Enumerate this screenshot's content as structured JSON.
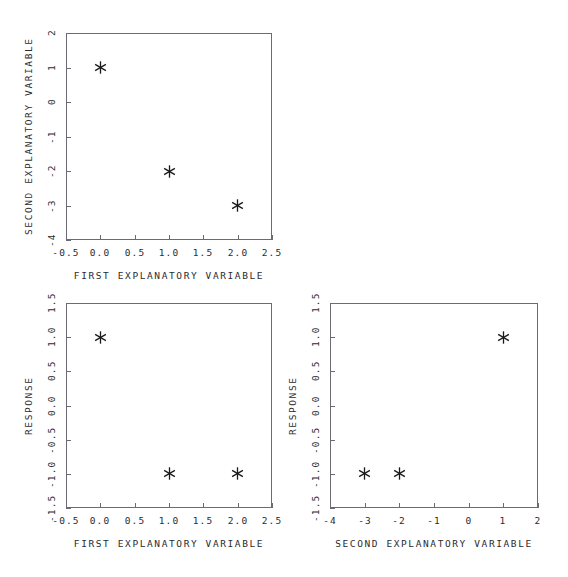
{
  "chart_data": [
    {
      "id": "top",
      "type": "scatter",
      "title": "",
      "xlabel": "FIRST EXPLANATORY VARIABLE",
      "ylabel": "SECOND EXPLANATORY VARIABLE",
      "xlim": [
        -0.5,
        2.5
      ],
      "ylim": [
        -4,
        2
      ],
      "xticks": [
        -0.5,
        0.0,
        0.5,
        1.0,
        1.5,
        2.0,
        2.5
      ],
      "xticklabels": [
        "-0.5",
        "0.0",
        "0.5",
        "1.0",
        "1.5",
        "2.0",
        "2.5"
      ],
      "yticks": [
        -4,
        -3,
        -2,
        -1,
        0,
        1,
        2
      ],
      "yticklabels": [
        "-4",
        "-3",
        "-2",
        "-1",
        "0",
        "1",
        "2"
      ],
      "grid": false,
      "legend": "none",
      "marker": "asterisk",
      "x": [
        0,
        1,
        2
      ],
      "y": [
        1,
        -2,
        -3
      ]
    },
    {
      "id": "bottom-left",
      "type": "scatter",
      "title": "",
      "xlabel": "FIRST EXPLANATORY VARIABLE",
      "ylabel": "RESPONSE",
      "xlim": [
        -0.5,
        2.5
      ],
      "ylim": [
        -1.5,
        1.5
      ],
      "xticks": [
        -0.5,
        0.0,
        0.5,
        1.0,
        1.5,
        2.0,
        2.5
      ],
      "xticklabels": [
        "-0.5",
        "0.0",
        "0.5",
        "1.0",
        "1.5",
        "2.0",
        "2.5"
      ],
      "yticks": [
        -1.5,
        -1.0,
        -0.5,
        0.0,
        0.5,
        1.0,
        1.5
      ],
      "yticklabels": [
        "-1.5",
        "-1.0",
        "-0.5",
        "0.0",
        "0.5",
        "1.0",
        "1.5"
      ],
      "grid": false,
      "legend": "none",
      "marker": "asterisk",
      "x": [
        0,
        1,
        2
      ],
      "y": [
        1,
        -1,
        -1
      ]
    },
    {
      "id": "bottom-right",
      "type": "scatter",
      "title": "",
      "xlabel": "SECOND EXPLANATORY VARIABLE",
      "ylabel": "RESPONSE",
      "xlim": [
        -4,
        2
      ],
      "ylim": [
        -1.5,
        1.5
      ],
      "xticks": [
        -4,
        -3,
        -2,
        -1,
        0,
        1,
        2
      ],
      "xticklabels": [
        "-4",
        "-3",
        "-2",
        "-1",
        "0",
        "1",
        "2"
      ],
      "yticks": [
        -1.5,
        -1.0,
        -0.5,
        0.0,
        0.5,
        1.0,
        1.5
      ],
      "yticklabels": [
        "-1.5",
        "-1.0",
        "-0.5",
        "0.0",
        "0.5",
        "1.0",
        "1.5"
      ],
      "grid": false,
      "legend": "none",
      "marker": "asterisk",
      "x": [
        1,
        -3,
        -2
      ],
      "y": [
        1,
        -1,
        -1
      ]
    }
  ],
  "style": {
    "background": "#ffffff",
    "axis_color": "#6b6b73",
    "text_color": "#2b2b30",
    "marker_color": "#1a1a1a"
  }
}
